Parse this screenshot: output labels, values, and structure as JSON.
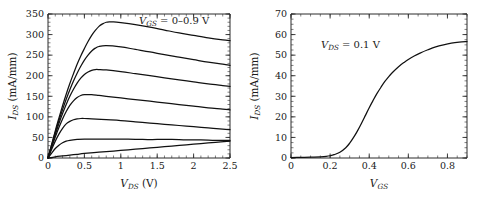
{
  "figure": {
    "background": "#ffffff",
    "curve_color": "#111111",
    "axis_color": "#2b2b2b"
  },
  "chart_data": [
    {
      "type": "line",
      "panel": "left",
      "title": "",
      "xlabel": "V_DS (V)",
      "xlabel_parts": {
        "var": "V",
        "sub": "DS",
        "unit": "(V)"
      },
      "ylabel": "I_DS (mA/mm)",
      "ylabel_parts": {
        "var": "I",
        "sub": "DS",
        "unit": "(mA/mm)"
      },
      "xlim": [
        0,
        2.5
      ],
      "ylim": [
        0,
        350
      ],
      "xticks": [
        0,
        0.5,
        1,
        1.5,
        2,
        2.5
      ],
      "xticklabels": [
        "0",
        "0.5",
        "1",
        "1.5",
        "2",
        "2.5"
      ],
      "yticks": [
        0,
        50,
        100,
        150,
        200,
        250,
        300,
        350
      ],
      "yticklabels": [
        "0",
        "50",
        "100",
        "150",
        "200",
        "250",
        "300",
        "350"
      ],
      "xminor_step": 0.1,
      "yminor_step": 10,
      "grid": false,
      "legend_position": "top-right-inside",
      "annotation": "V_GS = 0-0.9 V",
      "annotation_parts": {
        "var": "V",
        "sub": "GS",
        "rest": "= 0–0.9 V"
      },
      "series": [
        {
          "name": "VGS = 0.9 V",
          "vgs": 0.9,
          "x": [
            0,
            0.05,
            0.1,
            0.15,
            0.2,
            0.25,
            0.3,
            0.35,
            0.4,
            0.45,
            0.5,
            0.55,
            0.6,
            0.65,
            0.7,
            0.75,
            0.8,
            0.85,
            0.9,
            1.0,
            1.2,
            1.4,
            1.6,
            1.8,
            2.0,
            2.2,
            2.4,
            2.5
          ],
          "values": [
            0,
            33,
            66,
            97,
            127,
            155,
            181,
            205,
            228,
            248,
            266,
            283,
            298,
            310,
            320,
            326,
            330,
            331,
            331,
            329,
            324,
            318,
            311,
            304,
            298,
            292,
            287,
            285
          ]
        },
        {
          "name": "VGS = 0.75 V",
          "vgs": 0.75,
          "x": [
            0,
            0.05,
            0.1,
            0.15,
            0.2,
            0.25,
            0.3,
            0.35,
            0.4,
            0.45,
            0.5,
            0.55,
            0.6,
            0.65,
            0.7,
            0.8,
            1.0,
            1.2,
            1.4,
            1.6,
            1.8,
            2.0,
            2.2,
            2.4,
            2.5
          ],
          "values": [
            0,
            31,
            62,
            91,
            118,
            143,
            166,
            187,
            206,
            223,
            238,
            250,
            260,
            267,
            271,
            273,
            270,
            264,
            258,
            251,
            245,
            239,
            233,
            228,
            225
          ]
        },
        {
          "name": "VGS = 0.6 V",
          "vgs": 0.6,
          "x": [
            0,
            0.05,
            0.1,
            0.15,
            0.2,
            0.25,
            0.3,
            0.35,
            0.4,
            0.45,
            0.5,
            0.55,
            0.6,
            0.65,
            0.7,
            0.8,
            1.0,
            1.2,
            1.4,
            1.6,
            1.8,
            2.0,
            2.2,
            2.4,
            2.5
          ],
          "values": [
            0,
            29,
            57,
            84,
            108,
            130,
            150,
            167,
            182,
            194,
            203,
            209,
            213,
            215,
            215,
            214,
            210,
            205,
            200,
            195,
            190,
            185,
            180,
            176,
            174
          ]
        },
        {
          "name": "VGS = 0.45 V",
          "vgs": 0.45,
          "x": [
            0,
            0.05,
            0.1,
            0.15,
            0.2,
            0.25,
            0.3,
            0.35,
            0.4,
            0.45,
            0.5,
            0.55,
            0.6,
            0.7,
            0.8,
            1.0,
            1.2,
            1.4,
            1.6,
            1.8,
            2.0,
            2.2,
            2.4,
            2.5
          ],
          "values": [
            0,
            26,
            51,
            74,
            95,
            113,
            128,
            139,
            147,
            152,
            154,
            154,
            154,
            152,
            150,
            146,
            142,
            138,
            134,
            130,
            126,
            122,
            119,
            117
          ]
        },
        {
          "name": "VGS = 0.3 V",
          "vgs": 0.3,
          "x": [
            0,
            0.05,
            0.1,
            0.15,
            0.2,
            0.25,
            0.3,
            0.35,
            0.4,
            0.45,
            0.5,
            0.6,
            0.8,
            1.0,
            1.2,
            1.4,
            1.6,
            1.8,
            2.0,
            2.2,
            2.4,
            2.5
          ],
          "values": [
            0,
            21,
            41,
            58,
            72,
            83,
            89,
            93,
            95,
            96,
            96,
            95,
            93,
            91,
            88,
            85,
            82,
            79,
            76,
            73,
            70,
            69
          ]
        },
        {
          "name": "VGS = 0.15 V",
          "vgs": 0.15,
          "x": [
            0,
            0.05,
            0.1,
            0.15,
            0.2,
            0.25,
            0.3,
            0.4,
            0.5,
            0.7,
            0.9,
            1.1,
            1.3,
            1.5,
            1.7,
            1.9,
            2.1,
            2.3,
            2.5
          ],
          "values": [
            0,
            12,
            23,
            31,
            37,
            41,
            43,
            45,
            46,
            46,
            46,
            46,
            45,
            45,
            45,
            44,
            44,
            43,
            43
          ]
        },
        {
          "name": "VGS = 0 V",
          "vgs": 0,
          "x": [
            0,
            0.1,
            0.2,
            0.3,
            0.4,
            0.5,
            0.7,
            0.9,
            1.1,
            1.3,
            1.5,
            1.7,
            1.9,
            2.1,
            2.3,
            2.5
          ],
          "values": [
            0,
            3,
            5,
            7,
            9,
            11,
            14,
            17,
            20,
            23,
            26,
            29,
            32,
            35,
            38,
            41
          ]
        }
      ]
    },
    {
      "type": "line",
      "panel": "right",
      "title": "",
      "xlabel": "V_GS",
      "xlabel_parts": {
        "var": "V",
        "sub": "GS",
        "unit": ""
      },
      "ylabel": "I_DS (mA/mm)",
      "ylabel_parts": {
        "var": "I",
        "sub": "DS",
        "unit": "(mA/mm)"
      },
      "xlim": [
        0,
        0.9
      ],
      "ylim": [
        0,
        70
      ],
      "xticks": [
        0,
        0.2,
        0.4,
        0.6,
        0.8
      ],
      "xticklabels": [
        "0",
        "0.2",
        "0.4",
        "0.6",
        "0.8"
      ],
      "yticks": [
        0,
        10,
        20,
        30,
        40,
        50,
        60,
        70
      ],
      "yticklabels": [
        "0",
        "10",
        "20",
        "30",
        "40",
        "50",
        "60",
        "70"
      ],
      "xminor_step": 0.05,
      "yminor_step": 2.5,
      "grid": false,
      "annotation": "V_DS = 0.1 V",
      "annotation_parts": {
        "var": "V",
        "sub": "DS",
        "rest": "= 0.1 V"
      },
      "series": [
        {
          "name": "transfer",
          "x": [
            0,
            0.05,
            0.1,
            0.15,
            0.18,
            0.2,
            0.22,
            0.25,
            0.28,
            0.3,
            0.32,
            0.34,
            0.36,
            0.38,
            0.4,
            0.42,
            0.44,
            0.46,
            0.48,
            0.5,
            0.52,
            0.55,
            0.58,
            0.6,
            0.63,
            0.66,
            0.7,
            0.74,
            0.78,
            0.82,
            0.86,
            0.9
          ],
          "values": [
            0.2,
            0.3,
            0.4,
            0.6,
            0.8,
            1.1,
            1.6,
            2.8,
            5.0,
            7.2,
            10.0,
            13.2,
            16.8,
            20.6,
            24.4,
            28.0,
            31.4,
            34.4,
            37.2,
            39.6,
            41.7,
            44.4,
            46.6,
            47.9,
            49.6,
            51.0,
            52.6,
            54.0,
            55.0,
            55.8,
            56.3,
            56.6
          ]
        }
      ]
    }
  ]
}
